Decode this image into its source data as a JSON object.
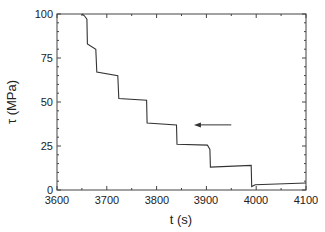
{
  "chart_data": {
    "type": "line",
    "title": "",
    "xlabel": "t (s)",
    "ylabel": "τ (MPa)",
    "xlim": [
      3600,
      4100
    ],
    "ylim": [
      0,
      100
    ],
    "x_ticks": [
      3600,
      3700,
      3800,
      3900,
      4000,
      4100
    ],
    "y_ticks": [
      0,
      25,
      50,
      75,
      100
    ],
    "x_tick_labels": [
      "3600",
      "3700",
      "3800",
      "3900",
      "4000",
      "4100"
    ],
    "y_tick_labels": [
      "0",
      "25",
      "50",
      "75",
      "100"
    ],
    "grid": false,
    "legend": null,
    "series": [
      {
        "name": "shear stress",
        "color": "#333333",
        "points": [
          [
            3650,
            100
          ],
          [
            3655,
            99
          ],
          [
            3660,
            97
          ],
          [
            3661,
            83
          ],
          [
            3678,
            80
          ],
          [
            3680,
            67
          ],
          [
            3722,
            65
          ],
          [
            3724,
            52
          ],
          [
            3780,
            51
          ],
          [
            3781,
            38
          ],
          [
            3840,
            37
          ],
          [
            3841,
            26
          ],
          [
            3902,
            25.5
          ],
          [
            3907,
            23
          ],
          [
            3908,
            13
          ],
          [
            3990,
            14
          ],
          [
            3991,
            2
          ],
          [
            3998,
            3
          ],
          [
            4100,
            4
          ]
        ]
      }
    ],
    "annotations": [
      {
        "type": "arrow",
        "from": [
          3950,
          37
        ],
        "to": [
          3875,
          37
        ],
        "text": ""
      }
    ]
  },
  "axes": {
    "x_label": "t (s)",
    "y_label": "τ (MPa)",
    "x_tick_labels": [
      "3600",
      "3700",
      "3800",
      "3900",
      "4000",
      "4100"
    ],
    "y_tick_labels": [
      "0",
      "25",
      "50",
      "75",
      "100"
    ]
  }
}
